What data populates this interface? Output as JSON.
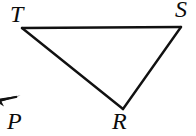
{
  "figure": {
    "type": "geometry-diagram",
    "background_color": "#ffffff",
    "stroke_color": "#111111",
    "stroke_width": 2.4,
    "canvas": {
      "width": 196,
      "height": 136
    },
    "vertices": [
      {
        "id": "T",
        "label": "T",
        "x": 22,
        "y": 28
      },
      {
        "id": "S",
        "label": "S",
        "x": 181,
        "y": 27
      },
      {
        "id": "R",
        "label": "R",
        "x": 123,
        "y": 109
      }
    ],
    "edges": [
      {
        "id": "TS",
        "from": "T",
        "to": "S"
      },
      {
        "id": "SR",
        "from": "S",
        "to": "R"
      },
      {
        "id": "RT",
        "from": "R",
        "to": "T"
      }
    ],
    "ray": {
      "id": "ray-P",
      "label": "P",
      "arrow_tip_x": 20,
      "arrow_tip_y": 96,
      "arrow_tail_x": 0,
      "arrow_tail_y": 106,
      "direction": "up-right"
    },
    "labels": [
      {
        "id": "T",
        "text": "T",
        "x": 10,
        "y": 2,
        "font_size": 24,
        "style": "italic"
      },
      {
        "id": "S",
        "text": "S",
        "x": 175,
        "y": -3,
        "font_size": 24,
        "style": "italic"
      },
      {
        "id": "R",
        "text": "R",
        "x": 112,
        "y": 109,
        "font_size": 24,
        "style": "italic"
      },
      {
        "id": "P",
        "text": "P",
        "x": 7,
        "y": 109,
        "font_size": 24,
        "style": "italic"
      }
    ]
  }
}
